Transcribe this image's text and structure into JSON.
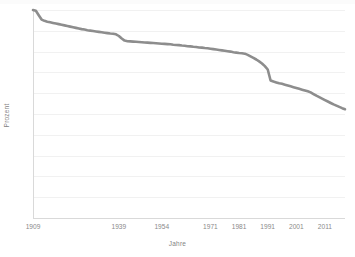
{
  "chart_data": {
    "type": "line",
    "title": "",
    "xlabel": "Jahre",
    "ylabel": "Prozent",
    "ylim": [
      0,
      100
    ],
    "xlim": [
      1909,
      2018
    ],
    "grid": true,
    "legend": false,
    "series_color": "#8d8d8d",
    "y_ticks": [
      0,
      10,
      20,
      30,
      40,
      50,
      60,
      70,
      80,
      90,
      100
    ],
    "x_ticks": [
      1909,
      1939,
      1954,
      1971,
      1981,
      1991,
      2001,
      2011
    ],
    "x_tick_labels": [
      "1909",
      "1939",
      "1954",
      "1971",
      "1981",
      "1991",
      "2001",
      "2011"
    ],
    "y_tick_labels": [
      "0",
      "10",
      "20",
      "30",
      "40",
      "50",
      "60",
      "70",
      "80",
      "90",
      "100"
    ],
    "series": [
      {
        "name": "Prozent",
        "x": [
          1909,
          1910,
          1911,
          1912,
          1913,
          1914,
          1915,
          1916,
          1917,
          1918,
          1919,
          1920,
          1921,
          1922,
          1923,
          1924,
          1925,
          1926,
          1927,
          1928,
          1929,
          1930,
          1931,
          1932,
          1933,
          1934,
          1935,
          1936,
          1937,
          1938,
          1939,
          1940,
          1941,
          1942,
          1943,
          1944,
          1945,
          1946,
          1947,
          1948,
          1949,
          1950,
          1951,
          1952,
          1953,
          1954,
          1955,
          1956,
          1957,
          1958,
          1959,
          1960,
          1961,
          1962,
          1963,
          1964,
          1965,
          1966,
          1967,
          1968,
          1969,
          1970,
          1971,
          1972,
          1973,
          1974,
          1975,
          1976,
          1977,
          1978,
          1979,
          1980,
          1981,
          1982,
          1983,
          1984,
          1985,
          1986,
          1987,
          1988,
          1989,
          1990,
          1991,
          1992,
          1993,
          1994,
          1995,
          1996,
          1997,
          1998,
          1999,
          2000,
          2001,
          2002,
          2003,
          2004,
          2005,
          2006,
          2007,
          2008,
          2009,
          2010,
          2011,
          2012,
          2013,
          2014,
          2015,
          2016,
          2017,
          2018
        ],
        "values": [
          100.0,
          99.6,
          97.5,
          95.4,
          94.8,
          94.4,
          94.1,
          93.8,
          93.5,
          93.2,
          92.9,
          92.6,
          92.3,
          92.0,
          91.7,
          91.4,
          91.1,
          90.8,
          90.6,
          90.3,
          90.1,
          89.9,
          89.7,
          89.5,
          89.3,
          89.1,
          88.9,
          88.7,
          88.6,
          88.3,
          87.5,
          86.3,
          85.3,
          85.0,
          84.9,
          84.8,
          84.7,
          84.6,
          84.5,
          84.4,
          84.3,
          84.2,
          84.1,
          84.0,
          83.9,
          83.8,
          83.7,
          83.6,
          83.5,
          83.3,
          83.2,
          83.1,
          82.9,
          82.8,
          82.6,
          82.5,
          82.3,
          82.2,
          82.0,
          81.9,
          81.7,
          81.6,
          81.4,
          81.2,
          81.0,
          80.8,
          80.6,
          80.4,
          80.2,
          80.0,
          79.7,
          79.5,
          79.3,
          79.2,
          79.0,
          78.4,
          77.7,
          77.0,
          76.2,
          75.3,
          74.3,
          73.0,
          71.4,
          66.1,
          65.6,
          65.2,
          64.8,
          64.5,
          64.1,
          63.7,
          63.3,
          62.9,
          62.5,
          62.1,
          61.7,
          61.3,
          60.9,
          60.4,
          59.6,
          58.8,
          58.1,
          57.4,
          56.7,
          56.0,
          55.3,
          54.6,
          54.0,
          53.4,
          52.8,
          52.3
        ]
      }
    ]
  }
}
